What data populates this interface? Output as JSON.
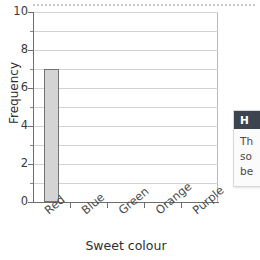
{
  "chart_data": {
    "type": "bar",
    "title": "",
    "xlabel": "Sweet colour",
    "ylabel": "Frequency",
    "categories": [
      "Red",
      "Blue",
      "Green",
      "Orange",
      "Purple"
    ],
    "values": [
      7,
      0,
      0,
      0,
      0
    ],
    "ylim": [
      0,
      10
    ],
    "ytick_labels": [
      "0",
      "2",
      "4",
      "6",
      "8",
      "10"
    ],
    "ytick_values": [
      0,
      2,
      4,
      6,
      8,
      10
    ],
    "yminor_values": [
      1,
      3,
      5,
      7,
      9
    ],
    "grid": true,
    "grid_axis": "y",
    "legend": false,
    "bar_fill": "#d4d4d4",
    "bar_edge": "#737373"
  },
  "callout": {
    "header": "H",
    "lines": [
      "Th",
      "so",
      "be"
    ]
  }
}
